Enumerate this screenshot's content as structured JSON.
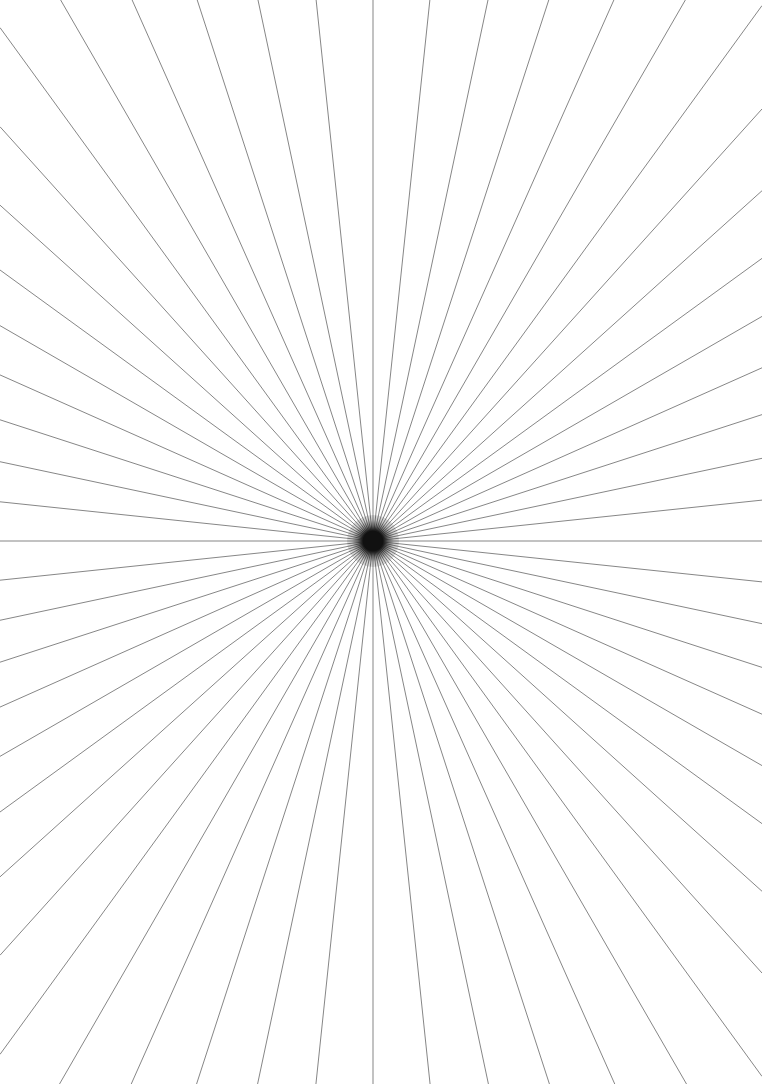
{
  "figure": {
    "width": 762,
    "height": 1084,
    "background_color": "#ffffff"
  },
  "chart_data": {
    "type": "line",
    "subtitle": "",
    "xlabel": "",
    "ylabel": "",
    "xlim": [
      0,
      762
    ],
    "ylim": [
      0,
      1084
    ],
    "grid": false,
    "legend": false,
    "center": {
      "x": 373,
      "y": 541
    },
    "ray_count": 60,
    "angle_step_degrees": 6,
    "angle_offset_degrees": 0,
    "line_color": "#808080",
    "line_width": 1,
    "line_opacity": 0.95,
    "center_blob": {
      "color": "#111111",
      "core_radius": 7,
      "halo_radius": 26
    },
    "annotations": [],
    "tick_labels": {
      "x": [],
      "y": []
    },
    "series": [
      {
        "name": "rays",
        "values": [
          0,
          6,
          12,
          18,
          24,
          30,
          36,
          42,
          48,
          54,
          60,
          66,
          72,
          78,
          84,
          90,
          96,
          102,
          108,
          114,
          120,
          126,
          132,
          138,
          144,
          150,
          156,
          162,
          168,
          174,
          180,
          186,
          192,
          198,
          204,
          210,
          216,
          222,
          228,
          234,
          240,
          246,
          252,
          258,
          264,
          270,
          276,
          282,
          288,
          294,
          300,
          306,
          312,
          318,
          324,
          330,
          336,
          342,
          348,
          354
        ]
      }
    ]
  }
}
